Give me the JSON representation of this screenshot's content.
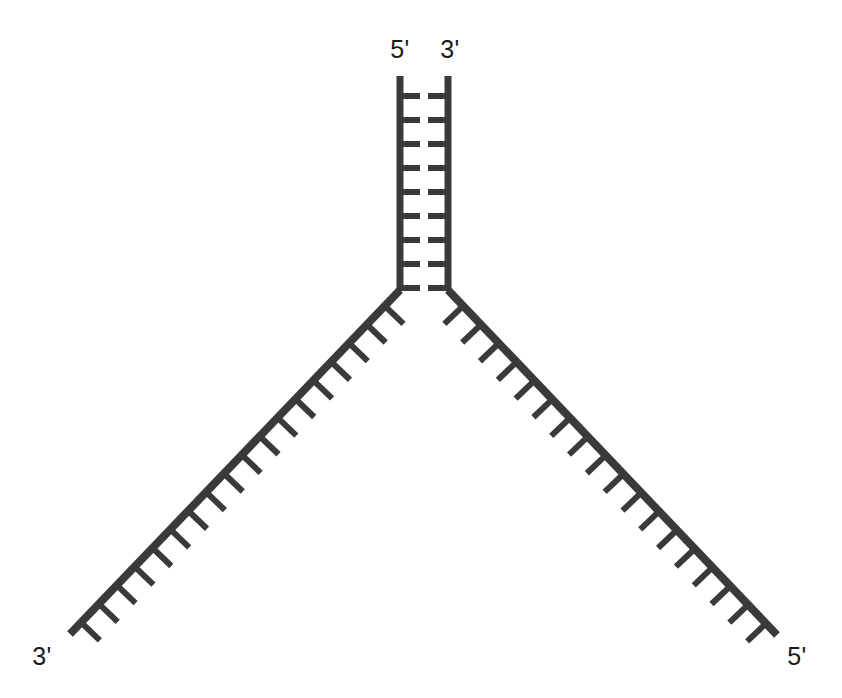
{
  "figure": {
    "name": "dna-replication-fork-diagram",
    "background_color": "#ffffff",
    "stroke_color": "#3a3a3a",
    "label_color": "#1a1a1a",
    "width": 842,
    "height": 698
  },
  "labels": {
    "stem_left": "5'",
    "stem_right": "3'",
    "arm_left_end": "3'",
    "arm_right_end": "5'"
  },
  "geometry": {
    "stem": {
      "left_strand_x": 400,
      "right_strand_x": 448,
      "top_y": 76,
      "bottom_y": 290,
      "strand_width": 7,
      "rung_count": 9,
      "rung_first_y": 96,
      "rung_spacing": 24,
      "rung_gap": 8,
      "rung_thickness": 6
    },
    "junction": {
      "x": 424,
      "y": 290
    },
    "left_arm": {
      "start_x": 400,
      "start_y": 290,
      "end_x": 70,
      "end_y": 634,
      "tick_count": 18,
      "tick_length": 26,
      "tick_width": 6,
      "tick_direction": "down-right"
    },
    "right_arm": {
      "start_x": 448,
      "start_y": 290,
      "end_x": 777,
      "end_y": 635,
      "tick_count": 18,
      "tick_length": 26,
      "tick_width": 6,
      "tick_direction": "down-left"
    },
    "label_positions": {
      "stem_left": {
        "x": 400,
        "y": 58,
        "anchor": "middle"
      },
      "stem_right": {
        "x": 450,
        "y": 58,
        "anchor": "middle"
      },
      "arm_left_end": {
        "x": 42,
        "y": 665,
        "anchor": "middle"
      },
      "arm_right_end": {
        "x": 797,
        "y": 665,
        "anchor": "middle"
      }
    }
  }
}
